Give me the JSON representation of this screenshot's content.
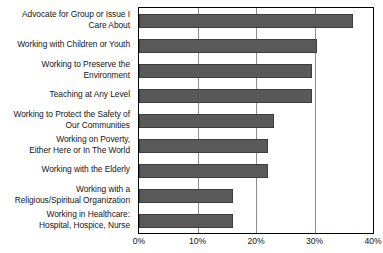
{
  "chart_data": {
    "type": "bar",
    "orientation": "horizontal",
    "title": "",
    "subtitle": "",
    "xlabel": "",
    "ylabel": "",
    "categories": [
      "Advocate for Group or Issue I Care About",
      "Working with Children or Youth",
      "Working to Preserve the Environment",
      "Teaching at Any Level",
      "Working to Protect the Safety of Our Communities",
      "Working on Poverty, Either Here or In The World",
      "Working with the Elderly",
      "Working with a Religious/Spiritual Organization",
      "Working in Healthcare: Hospital, Hospice, Nurse"
    ],
    "category_lines": [
      [
        "Advocate for Group or Issue I",
        "Care About"
      ],
      [
        "Working with Children or Youth"
      ],
      [
        "Working to Preserve the",
        "Environment"
      ],
      [
        "Teaching at Any Level"
      ],
      [
        "Working to Protect the Safety of",
        "Our Communities"
      ],
      [
        "Working on Poverty,",
        "Either Here or In The World"
      ],
      [
        "Working with the Elderly"
      ],
      [
        "Working with a",
        "Religious/Spiritual Organization"
      ],
      [
        "Working in Healthcare:",
        "Hospital, Hospice, Nurse"
      ]
    ],
    "values": [
      36.5,
      30.5,
      29.5,
      29.5,
      23.0,
      22.0,
      22.0,
      16.0,
      16.0
    ],
    "xlim": [
      0,
      40
    ],
    "tick_values": [
      0,
      10,
      20,
      30,
      40
    ],
    "tick_labels": [
      "0%",
      "10%",
      "20%",
      "30%",
      "40%"
    ],
    "grid": "vertical",
    "legend": "none",
    "bar_color": "#595959",
    "gridline_color": "#8d8d8d",
    "axis_color": "#000000",
    "background_color": "#ffffff",
    "text_color": "#151515"
  }
}
